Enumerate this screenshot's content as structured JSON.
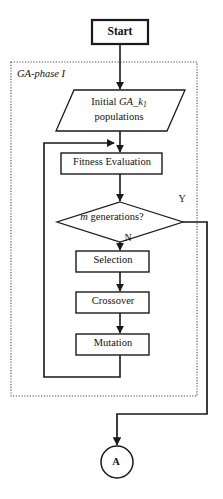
{
  "figure": {
    "width": 223,
    "height": 499,
    "background_color": "#ffffff",
    "line_color": "#1a1a1a",
    "group_border_style": "dotted"
  },
  "nodes": {
    "start": {
      "label": "Start",
      "shape": "terminator-rectangle",
      "bold": true
    },
    "group": {
      "label_prefix": "GA-phase",
      "label_suffix": "I",
      "label_full": "GA-phase I",
      "shape": "dotted-group-box"
    },
    "initial_populations": {
      "shape": "parallelogram-io",
      "line1_prefix": "Initial",
      "line1_var": "GA_k",
      "line1_sub": "1",
      "line2": "populations"
    },
    "fitness": {
      "label": "Fitness Evaluation",
      "shape": "process-rectangle"
    },
    "decision": {
      "shape": "decision-diamond",
      "var": "m",
      "text": "generations?",
      "branch_yes": "Y",
      "branch_no": "N"
    },
    "selection": {
      "label": "Selection",
      "shape": "process-rectangle"
    },
    "crossover": {
      "label": "Crossover",
      "shape": "process-rectangle"
    },
    "mutation": {
      "label": "Mutation",
      "shape": "process-rectangle"
    },
    "connector_a": {
      "label": "A",
      "shape": "circle-connector"
    }
  },
  "edges": [
    {
      "name": "start-to-initial",
      "from": "start",
      "to": "initial_populations",
      "label": ""
    },
    {
      "name": "initial-to-fitness",
      "from": "initial_populations",
      "to": "fitness",
      "label": ""
    },
    {
      "name": "fitness-to-decision",
      "from": "fitness",
      "to": "decision",
      "label": ""
    },
    {
      "name": "decision-yes-to-connector",
      "from": "decision",
      "to": "connector_a",
      "label": "Y"
    },
    {
      "name": "decision-no-to-selection",
      "from": "decision",
      "to": "selection",
      "label": "N"
    },
    {
      "name": "selection-to-crossover",
      "from": "selection",
      "to": "crossover",
      "label": ""
    },
    {
      "name": "crossover-to-mutation",
      "from": "crossover",
      "to": "mutation",
      "label": ""
    },
    {
      "name": "mutation-loopback-to-fitness",
      "from": "mutation",
      "to": "fitness",
      "label": ""
    }
  ]
}
